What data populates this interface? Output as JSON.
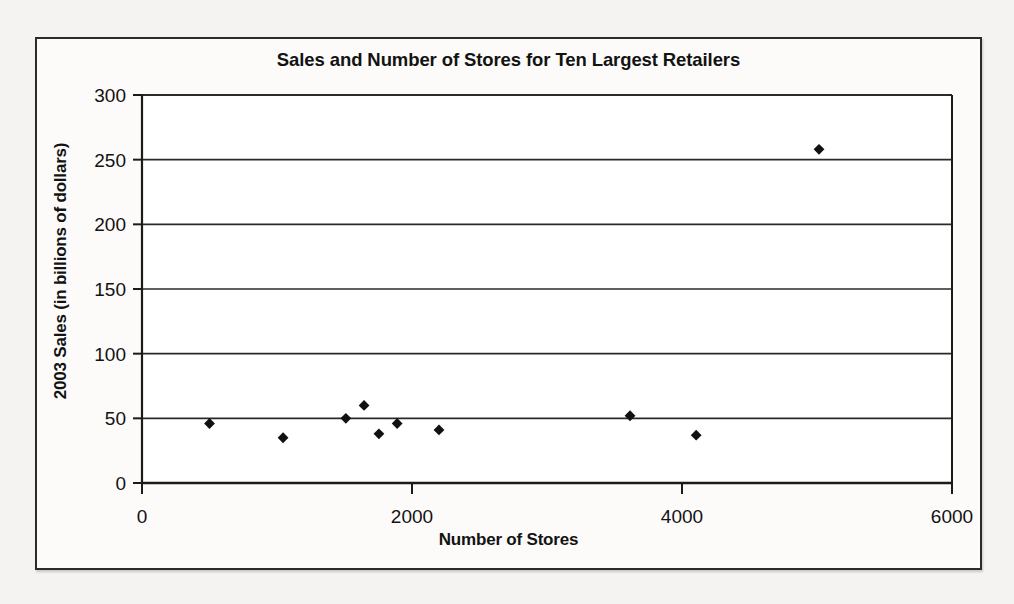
{
  "chart_data": {
    "type": "scatter",
    "title": "Sales and Number of Stores for Ten Largest Retailers",
    "xlabel": "Number of Stores",
    "ylabel": "2003 Sales (in billions of dollars)",
    "xlim": [
      0,
      6000
    ],
    "ylim": [
      0,
      300
    ],
    "xticks": [
      "0",
      "2000",
      "4000",
      "6000"
    ],
    "xtick_values": [
      0,
      2000,
      4000,
      6000
    ],
    "yticks": [
      "0",
      "50",
      "100",
      "150",
      "200",
      "250",
      "300"
    ],
    "ytick_values": [
      0,
      50,
      100,
      150,
      200,
      250,
      300
    ],
    "grid": "horizontal",
    "legend": "none",
    "marker": "diamond",
    "marker_color": "#111111",
    "points": [
      {
        "x": 500,
        "y": 46
      },
      {
        "x": 1045,
        "y": 35
      },
      {
        "x": 1510,
        "y": 50
      },
      {
        "x": 1645,
        "y": 60
      },
      {
        "x": 1755,
        "y": 38
      },
      {
        "x": 1890,
        "y": 46
      },
      {
        "x": 2200,
        "y": 41
      },
      {
        "x": 3615,
        "y": 52
      },
      {
        "x": 4105,
        "y": 37
      },
      {
        "x": 5015,
        "y": 258
      }
    ],
    "series": [
      {
        "name": "Ten Largest Retailers",
        "x": [
          500,
          1045,
          1510,
          1645,
          1755,
          1890,
          2200,
          3615,
          4105,
          5015
        ],
        "values": [
          46,
          35,
          50,
          60,
          38,
          46,
          41,
          52,
          37,
          258
        ]
      }
    ]
  },
  "colors": {
    "axis": "#1b1b1b",
    "gridline": "#2a2a2a",
    "marker": "#111111",
    "frame": "#2b2b2b",
    "paper": "#f4f3f1",
    "plot_background": "#ffffff"
  }
}
